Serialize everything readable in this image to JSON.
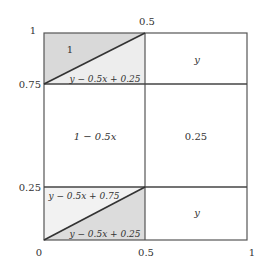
{
  "diagram": {
    "type": "piecewise-region-diagram",
    "axes": {
      "x_ticks": [
        "0",
        "0.5",
        "1"
      ],
      "y_ticks": [
        "0",
        "0.25",
        "0.75",
        "1"
      ],
      "top_tick": "0.5"
    },
    "regions": {
      "top_left_upper": "1",
      "top_left_lower": "y − 0.5x + 0.25",
      "top_right": "y",
      "middle_left": "1 − 0.5x",
      "middle_right": "0.25",
      "bottom_left_upper": "y − 0.5x + 0.75",
      "bottom_left_lower": "y − 0.5x + 0.25",
      "bottom_right": "y"
    },
    "colors": {
      "shade": "#dcdcdc",
      "shade_light": "#ececec",
      "line": "#444444"
    }
  }
}
